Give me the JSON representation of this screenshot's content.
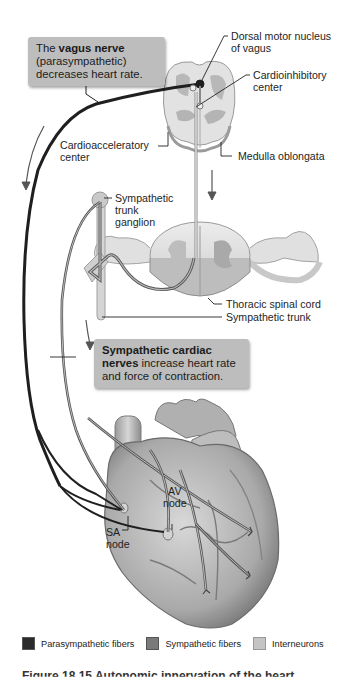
{
  "figure": {
    "callouts": {
      "vagus": {
        "pre": "The ",
        "bold": "vagus nerve",
        "line2": "(parasympathetic)",
        "line3": "decreases heart rate."
      },
      "sympathetic": {
        "bold1": "Sympathetic cardiac",
        "bold2": "nerves",
        "rest2": " increase heart rate",
        "line3": "and force of contraction."
      }
    },
    "labels": {
      "dorsal_motor_1": "Dorsal motor nucleus",
      "dorsal_motor_2": "of vagus",
      "cardioinhibitory_1": "Cardioinhibitory",
      "cardioinhibitory_2": "center",
      "cardioacceleratory_1": "Cardioacceleratory",
      "cardioacceleratory_2": "center",
      "medulla": "Medulla oblongata",
      "ganglion_1": "Sympathetic",
      "ganglion_2": "trunk",
      "ganglion_3": "ganglion",
      "thoracic": "Thoracic spinal cord",
      "symp_trunk": "Sympathetic trunk",
      "av_1": "AV",
      "av_2": "node",
      "sa_1": "SA",
      "sa_2": "node"
    },
    "legend": [
      {
        "label": "Parasympathetic fibers",
        "color": "#2b2b2b"
      },
      {
        "label": "Sympathetic fibers",
        "color": "#7a7a7a"
      },
      {
        "label": "Interneurons",
        "color": "#c4c4c4"
      }
    ],
    "caption": "Figure 18.15  Autonomic innervation of the heart."
  }
}
